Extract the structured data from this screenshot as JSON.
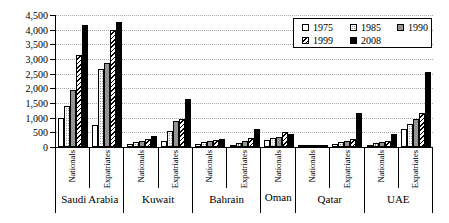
{
  "chart_data": {
    "type": "bar",
    "title": "",
    "xlabel": "",
    "ylabel": "",
    "ylim": [
      0,
      4500
    ],
    "ytick_step": 500,
    "ytick_labels": [
      "0",
      "500",
      "1,000",
      "1,500",
      "2,000",
      "2,500",
      "3,000",
      "3,500",
      "4,000",
      "4,500"
    ],
    "grid": "horizontal-dotted",
    "legend_position": "top-right-inside-box",
    "series": [
      {
        "name": "1975",
        "pattern": "plain",
        "color": "#ffffff"
      },
      {
        "name": "1985",
        "pattern": "dots",
        "color": "#ffffff-dotted"
      },
      {
        "name": "1990",
        "pattern": "gray",
        "color": "#949494"
      },
      {
        "name": "1999",
        "pattern": "hatch",
        "color": "#ffffff-diagonal-hatch"
      },
      {
        "name": "2008",
        "pattern": "black",
        "color": "#000000"
      }
    ],
    "countries": [
      {
        "name": "Saudi Arabia",
        "groups": [
          {
            "label": "Nationals",
            "values": [
              1000,
              1400,
              1950,
              3150,
              4150
            ]
          },
          {
            "label": "Expatriates",
            "values": [
              760,
              2650,
              2870,
              4000,
              4260
            ]
          }
        ]
      },
      {
        "name": "Kuwait",
        "groups": [
          {
            "label": "Nationals",
            "values": [
              90,
              180,
              220,
              280,
              390
            ]
          },
          {
            "label": "Expatriates",
            "values": [
              190,
              550,
              880,
              950,
              1650
            ]
          }
        ]
      },
      {
        "name": "Bahrain",
        "groups": [
          {
            "label": "Nationals",
            "values": [
              100,
              160,
              210,
              250,
              290
            ]
          },
          {
            "label": "Expatriates",
            "values": [
              80,
              150,
              220,
              300,
              630
            ]
          }
        ]
      },
      {
        "name": "Oman",
        "groups": [
          {
            "label": "Nationals",
            "values": [
              250,
              300,
              350,
              510,
              430
            ]
          }
        ]
      },
      {
        "name": "Qatar",
        "groups": [
          {
            "label": "Nationals",
            "values": [
              15,
              25,
              35,
              50,
              85
            ]
          },
          {
            "label": "Expatriates",
            "values": [
              90,
              175,
              205,
              260,
              1150
            ]
          }
        ]
      },
      {
        "name": "UAE",
        "groups": [
          {
            "label": "Nationals",
            "values": [
              60,
              135,
              180,
              215,
              450
            ]
          },
          {
            "label": "Expatriates",
            "values": [
              615,
              775,
              960,
              1170,
              2550
            ]
          }
        ]
      }
    ]
  },
  "colors": {
    "axis": "#000000",
    "gridline": "#a8a8a8",
    "bar_gray": "#949494",
    "bar_black": "#000000",
    "background": "#ffffff"
  }
}
